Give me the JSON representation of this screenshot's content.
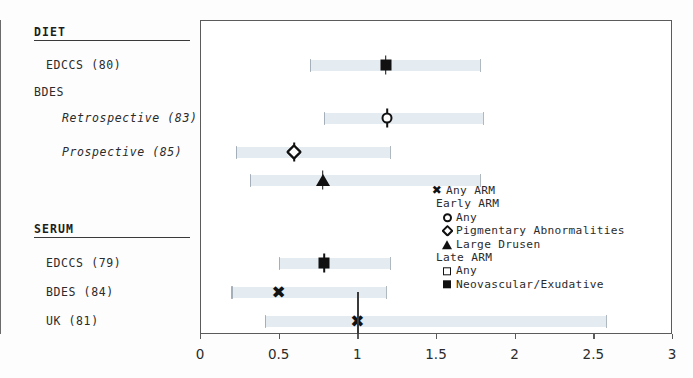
{
  "chart_data": {
    "type": "scatter",
    "title": "",
    "xlabel": "",
    "ylabel": "",
    "xlim": [
      0,
      3
    ],
    "xticks": [
      0,
      0.5,
      1,
      1.5,
      2,
      2.5,
      3
    ],
    "xtick_labels": [
      "0",
      "0.5",
      "1",
      "1.5",
      "2",
      "2.5",
      "3"
    ],
    "reference_line": 1,
    "grid": false,
    "legend_position": "inside-right",
    "sections": [
      {
        "name": "DIET",
        "rows": [
          {
            "label": "EDCCS (80)",
            "indent": 1,
            "italic": false,
            "marker": "square-filled",
            "series": "Neovascular/Exudative",
            "estimate": 1.18,
            "ci_low": 0.7,
            "ci_high": 1.78
          },
          {
            "label": "BDES",
            "indent": 0,
            "italic": false,
            "marker": "none",
            "series": "",
            "estimate": null,
            "ci_low": null,
            "ci_high": null
          },
          {
            "label": "Retrospective (83)",
            "indent": 2,
            "italic": true,
            "marker": "circle-open",
            "series": "Any (Early ARM)",
            "estimate": 1.19,
            "ci_low": 0.79,
            "ci_high": 1.8
          },
          {
            "label": "Prospective (85)",
            "indent": 2,
            "italic": true,
            "marker": "diamond-open",
            "series": "Pigmentary Abnormalities",
            "estimate": 0.6,
            "ci_low": 0.23,
            "ci_high": 1.21
          },
          {
            "label": "",
            "indent": 2,
            "italic": false,
            "marker": "triangle-filled",
            "series": "Large Drusen",
            "estimate": 0.78,
            "ci_low": 0.32,
            "ci_high": 1.78
          }
        ]
      },
      {
        "name": "SERUM",
        "rows": [
          {
            "label": "EDCCS (79)",
            "indent": 1,
            "italic": false,
            "marker": "square-filled",
            "series": "Neovascular/Exudative",
            "estimate": 0.79,
            "ci_low": 0.5,
            "ci_high": 1.21
          },
          {
            "label": "BDES (84)",
            "indent": 1,
            "italic": false,
            "marker": "x",
            "series": "Any ARM",
            "estimate": 0.5,
            "ci_low": 0.2,
            "ci_high": 1.18
          },
          {
            "label": "UK (81)",
            "indent": 1,
            "italic": false,
            "marker": "x",
            "series": "Any ARM",
            "estimate": 1.0,
            "ci_low": 0.41,
            "ci_high": 2.58
          }
        ]
      }
    ],
    "legend": [
      {
        "glyph": "x",
        "label": "Any ARM",
        "kind": "entry",
        "indent": 0
      },
      {
        "glyph": "",
        "label": "Early ARM",
        "kind": "header",
        "indent": 0
      },
      {
        "glyph": "circle-open",
        "label": "Any",
        "kind": "entry",
        "indent": 1
      },
      {
        "glyph": "diamond-open",
        "label": "Pigmentary Abnormalities",
        "kind": "entry",
        "indent": 1
      },
      {
        "glyph": "triangle-filled",
        "label": "Large Drusen",
        "kind": "entry",
        "indent": 1
      },
      {
        "glyph": "",
        "label": "Late ARM",
        "kind": "header",
        "indent": 0
      },
      {
        "glyph": "square-open",
        "label": "Any",
        "kind": "entry",
        "indent": 1
      },
      {
        "glyph": "square-filled",
        "label": "Neovascular/Exudative",
        "kind": "entry",
        "indent": 1
      }
    ]
  },
  "colors": {
    "marker": "#111111",
    "ci_band": "#dfe7ef",
    "frame": "#5b5b5b",
    "reference_line": "#6b6b6b",
    "text": "#2b2b2b"
  }
}
